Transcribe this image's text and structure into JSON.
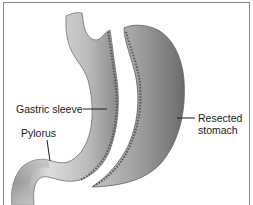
{
  "figure": {
    "labels": {
      "gastric_sleeve": "Gastric sleeve",
      "pylorus": "Pylorus",
      "resected_stomach": "Resected stomach"
    },
    "colors": {
      "frame": "#8a8a8a",
      "tissue_light": "#d8d8d8",
      "tissue_dark": "#7a7a7a",
      "staple_line": "#555555",
      "text": "#1a1a1a"
    }
  }
}
